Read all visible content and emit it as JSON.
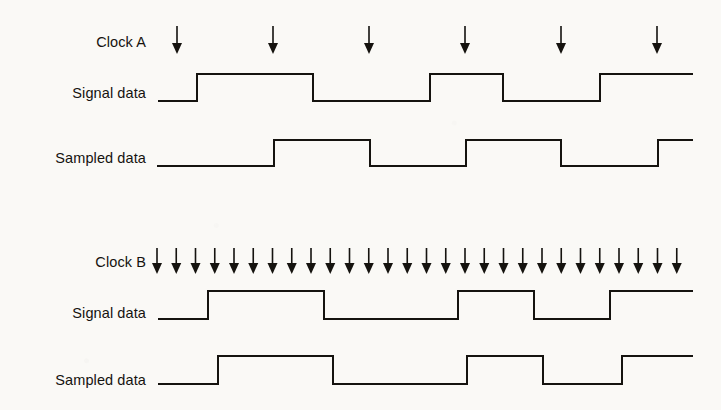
{
  "figure": {
    "type": "timing-diagram",
    "title": "",
    "background_color": "#faf9f6",
    "line_color": "#15130f",
    "label_color": "#15130f"
  },
  "labels": {
    "clock_a": "Clock A",
    "signal_data_a": "Signal data",
    "sampled_data_a": "Sampled data",
    "clock_b": "Clock B",
    "signal_data_b": "Signal data",
    "sampled_data_b": "Sampled data"
  },
  "label_positions": {
    "clock_a": {
      "x": 146,
      "y": 42
    },
    "signal_data_a": {
      "x": 146,
      "y": 93
    },
    "sampled_data_a": {
      "x": 146,
      "y": 158
    },
    "clock_b": {
      "x": 146,
      "y": 262
    },
    "signal_data_b": {
      "x": 146,
      "y": 313
    },
    "sampled_data_b": {
      "x": 146,
      "y": 380
    }
  },
  "chart_data": {
    "type": "line",
    "xlabel": "",
    "ylabel": "",
    "groups": [
      {
        "name": "Clock A",
        "clock_arrow_count": 6,
        "clock_arrow_x": [
          177,
          273,
          369,
          465,
          561,
          657
        ],
        "arrow_top_y": 26,
        "arrow_tip_y": 54,
        "traces": [
          {
            "name": "Signal data",
            "low_y": 101,
            "high_y": 74,
            "x_start": 158,
            "x_end": 693,
            "transitions": [
              {
                "x": 197,
                "to": "high"
              },
              {
                "x": 313,
                "to": "low"
              },
              {
                "x": 430,
                "to": "high"
              },
              {
                "x": 503,
                "to": "low"
              },
              {
                "x": 600,
                "to": "high"
              }
            ],
            "start_level": "low",
            "end_level": "high"
          },
          {
            "name": "Sampled data",
            "low_y": 166,
            "high_y": 140,
            "x_start": 157,
            "x_end": 693,
            "transitions": [
              {
                "x": 274,
                "to": "high"
              },
              {
                "x": 370,
                "to": "low"
              },
              {
                "x": 466,
                "to": "high"
              },
              {
                "x": 561,
                "to": "low"
              },
              {
                "x": 658,
                "to": "high"
              }
            ],
            "start_level": "low",
            "end_level": "high"
          }
        ]
      },
      {
        "name": "Clock B",
        "clock_arrow_count": 28,
        "clock_arrow_first_x": 157,
        "clock_arrow_spacing": 19.25,
        "arrow_top_y": 248,
        "arrow_tip_y": 274,
        "traces": [
          {
            "name": "Signal data",
            "low_y": 319,
            "high_y": 291,
            "x_start": 158,
            "x_end": 693,
            "transitions": [
              {
                "x": 208,
                "to": "high"
              },
              {
                "x": 324,
                "to": "low"
              },
              {
                "x": 458,
                "to": "high"
              },
              {
                "x": 534,
                "to": "low"
              },
              {
                "x": 610,
                "to": "high"
              }
            ],
            "start_level": "low",
            "end_level": "high"
          },
          {
            "name": "Sampled data",
            "low_y": 384,
            "high_y": 356,
            "x_start": 158,
            "x_end": 693,
            "transitions": [
              {
                "x": 218,
                "to": "high"
              },
              {
                "x": 333,
                "to": "low"
              },
              {
                "x": 467,
                "to": "high"
              },
              {
                "x": 543,
                "to": "low"
              },
              {
                "x": 622,
                "to": "high"
              }
            ],
            "start_level": "low",
            "end_level": "high"
          }
        ]
      }
    ]
  }
}
